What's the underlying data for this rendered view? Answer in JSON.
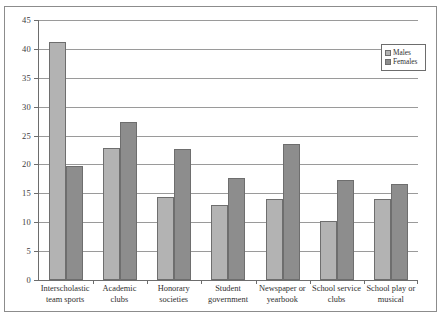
{
  "chart_data": {
    "type": "bar",
    "title": "",
    "subtitle": "",
    "xlabel": "",
    "ylabel": "",
    "ylim": [
      0,
      45
    ],
    "ytick_step": 5,
    "yticks": [
      0,
      5,
      10,
      15,
      20,
      25,
      30,
      35,
      40,
      45
    ],
    "grid": true,
    "legend_position": "top-right",
    "categories": [
      "Interscholastic team sports",
      "Academic clubs",
      "Honorary societies",
      "Student government",
      "Newspaper or yearbook",
      "School service clubs",
      "School play or musical"
    ],
    "category_lines": [
      [
        "Interscholastic",
        "team sports"
      ],
      [
        "Academic clubs",
        ""
      ],
      [
        "Honorary",
        "societies"
      ],
      [
        "Student",
        "government"
      ],
      [
        "Newspaper or",
        "yearbook"
      ],
      [
        "School service",
        "clubs"
      ],
      [
        "School play or",
        "musical"
      ]
    ],
    "series": [
      {
        "name": "Males",
        "color": "#b3b3b3",
        "values": [
          41.2,
          22.9,
          14.3,
          13.0,
          14.0,
          10.2,
          14.0
        ]
      },
      {
        "name": "Females",
        "color": "#8d8d8d",
        "values": [
          19.8,
          27.3,
          22.6,
          17.6,
          23.5,
          17.3,
          16.6
        ]
      }
    ]
  },
  "legend": {
    "items": [
      {
        "label": "Males",
        "swatch": "males"
      },
      {
        "label": "Females",
        "swatch": "females"
      }
    ]
  },
  "colors": {
    "males": "#b3b3b3",
    "females": "#8d8d8d",
    "axis": "#6d6d6d",
    "grid": "#9a9a9a",
    "frame": "#8c8c8c",
    "text": "#2f2f2f"
  }
}
